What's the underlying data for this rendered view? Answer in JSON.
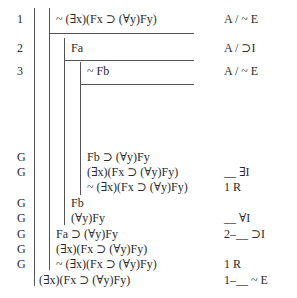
{
  "proof": {
    "lines": [
      {
        "num": "1",
        "formula": "~ (∃x)(Fx ⊃ (∀y)Fy)",
        "just": "A / ~ E",
        "top": 12,
        "left": 56
      },
      {
        "num": "2",
        "formula": "Fa",
        "just": "A / ⊃I",
        "top": 41,
        "left": 71
      },
      {
        "num": "3",
        "formula": "~ Fb",
        "just": "A / ~ E",
        "top": 64,
        "left": 87
      },
      {
        "num": "G",
        "formula": "Fb ⊃ (∀y)Fy",
        "just": "",
        "top": 150,
        "left": 87
      },
      {
        "num": "G",
        "formula": "(∃x)(Fx ⊃ (∀y)Fy)",
        "just": "__ ∃I",
        "top": 165,
        "left": 87
      },
      {
        "num": "",
        "formula": "~ (∃x)(Fx ⊃ (∀y)Fy)",
        "just": "1 R",
        "top": 180,
        "left": 87
      },
      {
        "num": "G",
        "formula": "Fb",
        "just": "",
        "top": 196,
        "left": 71
      },
      {
        "num": "G",
        "formula": "(∀y)Fy",
        "just": "__ ∀I",
        "top": 211,
        "left": 71
      },
      {
        "num": "G",
        "formula": "Fa ⊃ (∀y)Fy",
        "just": "2–__ ⊃I",
        "top": 227,
        "left": 56
      },
      {
        "num": "G",
        "formula": "(∃x)(Fx ⊃ (∀y)Fy)",
        "just": "",
        "top": 242,
        "left": 56
      },
      {
        "num": "G",
        "formula": "~ (∃x)(Fx ⊃ (∀y)Fy)",
        "just": "1 R",
        "top": 257,
        "left": 56
      },
      {
        "num": "",
        "formula": "(∃x)(Fx ⊃ (∀y)Fy)",
        "just": "1–__ ~ E",
        "top": 273,
        "left": 39
      }
    ]
  }
}
